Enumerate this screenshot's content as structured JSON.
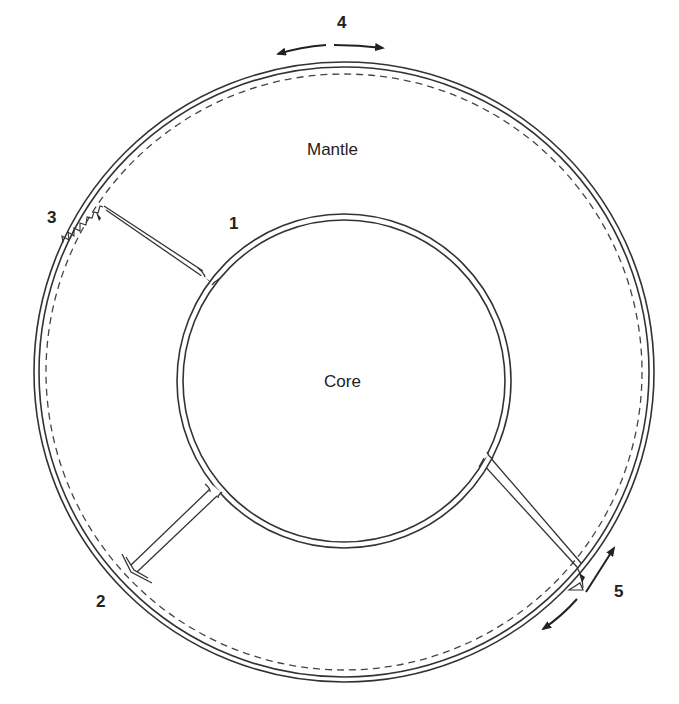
{
  "diagram": {
    "type": "earth-cross-section",
    "regions": {
      "mantle_label": "Mantle",
      "core_label": "Core"
    },
    "markers": [
      {
        "id": "1",
        "label": "1",
        "description": "plume root at core-mantle boundary (upper left)"
      },
      {
        "id": "2",
        "label": "2",
        "description": "plume reaching base of lithosphere (lower left, arrowhead)"
      },
      {
        "id": "3",
        "label": "3",
        "description": "plume head under volcanic chain (upper left, triangles)"
      },
      {
        "id": "4",
        "label": "4",
        "description": "diverging surface motion (top)"
      },
      {
        "id": "5",
        "label": "5",
        "description": "plume with shearing plate motion (lower right)"
      }
    ],
    "colors": {
      "line": "#333333",
      "background": "#ffffff"
    }
  }
}
